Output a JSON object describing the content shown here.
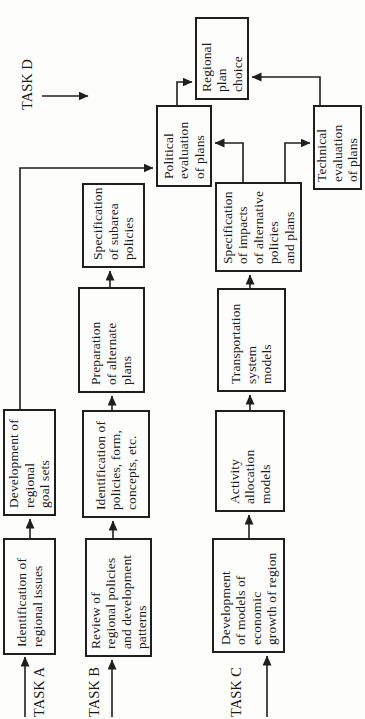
{
  "figure": {
    "background_color": "#fdfdfb",
    "line_color": "#1f1f1f",
    "text_color": "#1a1a1a",
    "orientation": "rotated-90-ccw",
    "task_labels": [
      {
        "id": "task-a",
        "text": "TASK A"
      },
      {
        "id": "task-b",
        "text": "TASK B"
      },
      {
        "id": "task-c",
        "text": "TASK C"
      },
      {
        "id": "task-d",
        "text": "TASK D"
      }
    ],
    "boxes": [
      {
        "id": "identification-regional-issues",
        "label": "Identification of\nregional issues"
      },
      {
        "id": "development-regional-goal-sets",
        "label": "Development of\nregional\ngoal sets"
      },
      {
        "id": "review-regional-policies",
        "label": "Review of\nregional policies\nand development\npatterns"
      },
      {
        "id": "identification-policies-form",
        "label": "Identification of\npolicies, form,\nconcepts, etc."
      },
      {
        "id": "preparation-alternate-plans",
        "label": "Preparation\nof alternate\nplans"
      },
      {
        "id": "specification-subarea-policies",
        "label": "Specification\nof subarea\npolicies"
      },
      {
        "id": "development-models-economic-growth",
        "label": "Development\nof models of\neconomic\ngrowth of region"
      },
      {
        "id": "activity-allocation-models",
        "label": "Activity\nallocation\nmodels"
      },
      {
        "id": "transportation-system-models",
        "label": "Transportation\nsystem\nmodels"
      },
      {
        "id": "specification-of-impacts",
        "label": "Specification\nof impacts\nof alternative\npolicies\nand plans"
      },
      {
        "id": "political-evaluation-of-plans",
        "label": "Political\nevaluation\nof plans"
      },
      {
        "id": "technical-evaluation-of-plans",
        "label": "Technical\nevaluation\nof plans"
      },
      {
        "id": "regional-plan-choice",
        "label": "Regional\nplan\nchoice"
      }
    ]
  }
}
